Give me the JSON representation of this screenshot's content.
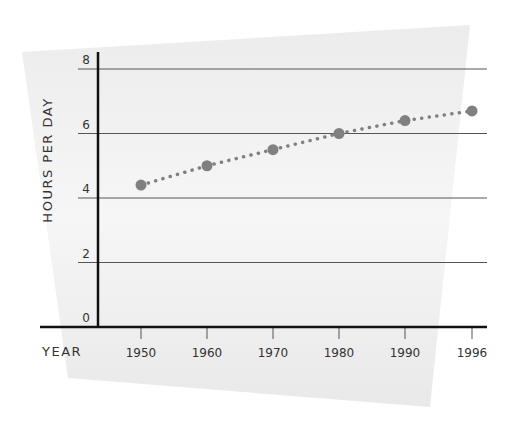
{
  "chart_data": {
    "type": "line",
    "title": "",
    "xlabel": "YEAR",
    "ylabel": "HOURS PER DAY",
    "categories": [
      "1950",
      "1960",
      "1970",
      "1980",
      "1990",
      "1996"
    ],
    "x": [
      1950,
      1960,
      1970,
      1980,
      1990,
      1996
    ],
    "values": [
      4.4,
      5.0,
      5.5,
      6.0,
      6.4,
      6.7
    ],
    "series": [
      {
        "name": "Hours per day",
        "values": [
          4.4,
          5.0,
          5.5,
          6.0,
          6.4,
          6.7
        ]
      }
    ],
    "yticks": [
      "0",
      "2",
      "4",
      "6",
      "8"
    ],
    "ylim": [
      0,
      8
    ],
    "grid": true,
    "line_style": "dotted",
    "marker": "circle",
    "legend": null
  },
  "colors": {
    "series": "#808080",
    "axis": "#111111",
    "grid": "#555555",
    "backdrop": "#eeeeee",
    "text": "#333333"
  }
}
